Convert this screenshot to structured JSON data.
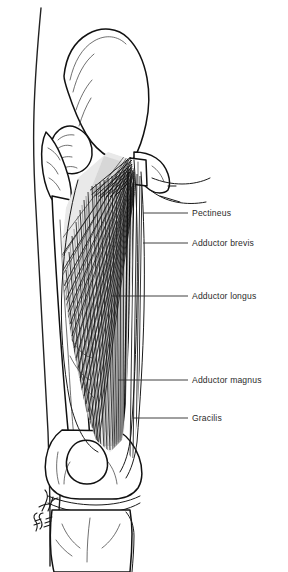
{
  "figure": {
    "view": "anterior",
    "background_color": "#ffffff",
    "ink_color": "#111111",
    "label_color": "#2b2b2b",
    "muscle_shade_color": "#d8d8d8"
  },
  "labels": [
    {
      "id": "pectineus",
      "text": "Pectineus",
      "text_x": 192,
      "text_y": 209,
      "leader": {
        "x1": 143,
        "y1": 213,
        "x2": 188,
        "y2": 213
      }
    },
    {
      "id": "adductor-brevis",
      "text": "Adductor brevis",
      "text_x": 192,
      "text_y": 239,
      "leader": {
        "x1": 143,
        "y1": 243,
        "x2": 188,
        "y2": 243
      }
    },
    {
      "id": "adductor-longus",
      "text": "Adductor longus",
      "text_x": 192,
      "text_y": 292,
      "leader": {
        "x1": 112,
        "y1": 296,
        "x2": 188,
        "y2": 296
      }
    },
    {
      "id": "adductor-magnus",
      "text": "Adductor magnus",
      "text_x": 192,
      "text_y": 376,
      "leader": {
        "x1": 118,
        "y1": 380,
        "x2": 188,
        "y2": 380
      }
    },
    {
      "id": "gracilis",
      "text": "Gracilis",
      "text_x": 192,
      "text_y": 414,
      "leader": {
        "x1": 133,
        "y1": 418,
        "x2": 188,
        "y2": 418
      }
    }
  ],
  "structures": [
    {
      "id": "ilium",
      "name": "Ilium / iliac blade"
    },
    {
      "id": "femoral-head",
      "name": "Head of femur"
    },
    {
      "id": "greater-trochanter",
      "name": "Greater trochanter"
    },
    {
      "id": "pubic-ramus",
      "name": "Superior and inferior pubic ramus"
    },
    {
      "id": "femur-shaft",
      "name": "Shaft of femur"
    },
    {
      "id": "patella",
      "name": "Patella"
    },
    {
      "id": "femoral-condyles",
      "name": "Femoral condyles"
    },
    {
      "id": "tibia",
      "name": "Tibia"
    },
    {
      "id": "fibula",
      "name": "Fibula"
    },
    {
      "id": "body-contour",
      "name": "Lateral skin contour of thigh"
    }
  ],
  "signature": {
    "present": true,
    "description": "hand-written artist signature, rotated vertically, lower left"
  }
}
